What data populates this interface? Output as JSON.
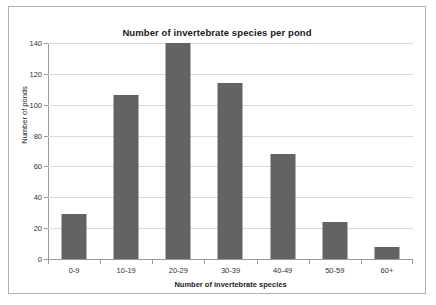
{
  "chart_data": {
    "type": "bar",
    "title": "Number of invertebrate species per pond",
    "xlabel": "Number of invertebrate species",
    "ylabel": "Number of ponds",
    "categories": [
      "0-9",
      "10-19",
      "20-29",
      "30-39",
      "40-49",
      "50-59",
      "60+"
    ],
    "values": [
      29,
      106,
      140,
      114,
      68,
      24,
      8
    ],
    "ylim": [
      0,
      140
    ],
    "ytick_labels": [
      "0",
      "20",
      "40",
      "60",
      "80",
      "100",
      "120",
      "140"
    ],
    "yticks": [
      0,
      20,
      40,
      60,
      80,
      100,
      120,
      140
    ],
    "grid": "horizontal",
    "legend": "none",
    "bar_color": "#636363",
    "gridline_color": "#d9d9d9",
    "axis_color": "#9a9a9a",
    "background_color": "#ffffff",
    "border_color": "#b0b0b0"
  }
}
